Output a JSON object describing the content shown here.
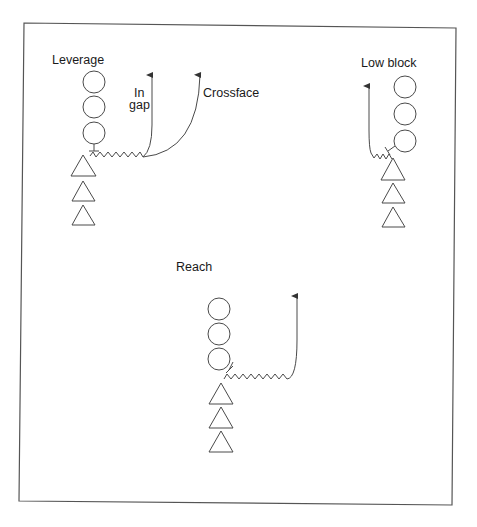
{
  "diagram": {
    "type": "football blocking schemes",
    "colors": {
      "line": "#4a4a4a",
      "frame": "#555555",
      "text": "#1a1a1a",
      "background": "#ffffff"
    },
    "legend_symbols": {
      "circle": "defensive player",
      "triangle": "offensive player",
      "zigzag": "block/drive",
      "arrow": "player path"
    },
    "panels": [
      {
        "id": "leverage",
        "title": "Leverage",
        "route_labels": [
          {
            "line1": "In",
            "line2": "gap"
          },
          {
            "line1": "Crossface"
          }
        ],
        "defenders": 3,
        "offense": 3
      },
      {
        "id": "low-block",
        "title": "Low block",
        "defenders": 3,
        "offense": 3
      },
      {
        "id": "reach",
        "title": "Reach",
        "defenders": 3,
        "offense": 3
      }
    ]
  }
}
